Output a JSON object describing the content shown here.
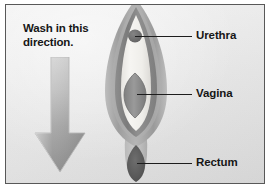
{
  "figure": {
    "kind": "anatomical-hygiene-diagram",
    "frame_border_color": "#585858",
    "background_color": "#e9e9e9",
    "text_color": "#161616"
  },
  "instruction": {
    "line1": "Wash in this",
    "line2": "direction.",
    "full_text": "Wash in this direction."
  },
  "arrow": {
    "name": "down-arrow-icon",
    "direction": "down",
    "gradient_top_color": "#d2d2d2",
    "gradient_bottom_color": "#8e8e8e",
    "outline_color": "#b0b0b0"
  },
  "labels": [
    {
      "id": "urethra",
      "text": "Urethra"
    },
    {
      "id": "vagina",
      "text": "Vagina"
    },
    {
      "id": "rectum",
      "text": "Rectum"
    }
  ],
  "anatomy": {
    "parts": [
      {
        "id": "outer-labia",
        "name": "outer-labia-shape",
        "color": "#a9a9a9"
      },
      {
        "id": "inner-labia",
        "name": "inner-labia-shape",
        "color": "#8a8a8a"
      },
      {
        "id": "vestibule",
        "name": "vestibule-shape",
        "color": "#f2f1ee"
      },
      {
        "id": "urethra-dot",
        "name": "urethra-opening",
        "color": "#6a6a6a"
      },
      {
        "id": "vagina-shape",
        "name": "vaginal-opening",
        "color": "#8b8b8b"
      },
      {
        "id": "perineum",
        "name": "perineum-shape",
        "color": "#b4b4b4"
      },
      {
        "id": "rectum-shape",
        "name": "anal-opening",
        "color": "#5e5e5e"
      }
    ]
  }
}
